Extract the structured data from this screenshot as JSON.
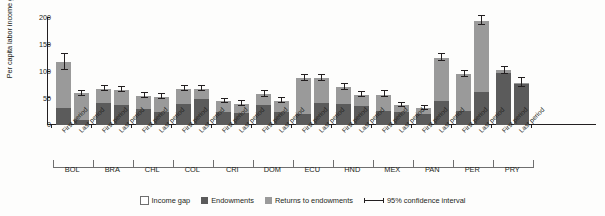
{
  "chart_data": {
    "type": "bar",
    "title": "",
    "xlabel": "",
    "ylabel": "Per capita labor income gap (%)",
    "ylim": [
      0,
      200
    ],
    "yticks": [
      0,
      50,
      100,
      150,
      200
    ],
    "ytick_labels": [
      "0",
      "50",
      "100",
      "150",
      "200"
    ],
    "grid": false,
    "stacked": true,
    "legend_position": "bottom-center",
    "categories": [
      "BOL First period",
      "BOL Last period",
      "BRA First period",
      "BRA Last period",
      "CHL First period",
      "CHL Last period",
      "COL First period",
      "COL Last period",
      "CRI First period",
      "CRI Last period",
      "DOM First period",
      "DOM Last period",
      "ECU First period",
      "ECU Last period",
      "HND First period",
      "HND Last period",
      "MEX First period",
      "MEX Last period",
      "PAN First period",
      "PAN Last period",
      "PER First period",
      "PER Last period",
      "PRY First period",
      "PRY Last period"
    ],
    "countries": [
      "BOL",
      "BRA",
      "CHL",
      "COL",
      "CRI",
      "DOM",
      "ECU",
      "HND",
      "MEX",
      "PAN",
      "PER",
      "PRY"
    ],
    "period_labels": [
      "First period",
      "Last period"
    ],
    "series": [
      {
        "name": "Endowments",
        "color": "#5b5b5b",
        "values": [
          31,
          10,
          42,
          37,
          30,
          25,
          39,
          48,
          25,
          23,
          37,
          25,
          21,
          41,
          39,
          35,
          27,
          24,
          20,
          45,
          27,
          62,
          97,
          77
        ]
      },
      {
        "name": "Returns to endowments",
        "color": "#9a9a9a",
        "values": [
          87,
          49,
          25,
          29,
          24,
          28,
          28,
          19,
          20,
          17,
          21,
          20,
          66,
          46,
          32,
          22,
          30,
          13,
          12,
          80,
          68,
          133,
          5,
          2
        ]
      }
    ],
    "totals": [
      118,
      59,
      67,
      66,
      54,
      53,
      67,
      67,
      45,
      40,
      58,
      45,
      87,
      87,
      71,
      57,
      57,
      37,
      32,
      125,
      95,
      195,
      102,
      79
    ],
    "error_bars": {
      "name": "95% confidence interval",
      "lower": [
        103,
        54,
        63,
        62,
        50,
        49,
        63,
        63,
        41,
        36,
        53,
        41,
        82,
        82,
        66,
        53,
        52,
        33,
        29,
        119,
        89,
        187,
        95,
        71
      ],
      "upper": [
        132,
        64,
        72,
        71,
        59,
        58,
        72,
        72,
        49,
        44,
        63,
        50,
        93,
        93,
        77,
        62,
        63,
        42,
        36,
        132,
        101,
        203,
        109,
        87
      ]
    },
    "legend": [
      {
        "label": "Income gap",
        "swatch": "income-gap-swatch"
      },
      {
        "label": "Endowments",
        "swatch": "endowments-swatch"
      },
      {
        "label": "Returns to endowments",
        "swatch": "returns-swatch"
      },
      {
        "label": "95% confidence interval",
        "swatch": "confidence-interval-swatch"
      }
    ]
  }
}
